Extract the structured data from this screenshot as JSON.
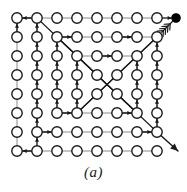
{
  "figure": {
    "caption": "(a)",
    "type": "node-link-grid-diagram"
  },
  "colors": {
    "background": "#ffffff",
    "node_stroke": "#1a1a1a",
    "node_fill": "#ffffff",
    "goal_fill": "#000000",
    "edge_plain": "#8a8a8a",
    "edge_directed": "#1a1a1a"
  },
  "grid": {
    "rows": 8,
    "cols": 8,
    "origin_x": 17,
    "origin_y": 18,
    "step_x": 20,
    "step_y": 19,
    "node_radius": 5.2,
    "node_stroke_width": 1.4
  },
  "goal_node": {
    "label": "goal",
    "row": 0,
    "col": 8,
    "x": 176,
    "y": 18,
    "radius": 4.2,
    "filled": true
  },
  "plain_edges": [
    {
      "r1": 0,
      "c1": 0,
      "r2": 0,
      "c2": 1
    },
    {
      "r1": 0,
      "c1": 1,
      "r2": 0,
      "c2": 2
    },
    {
      "r1": 0,
      "c1": 2,
      "r2": 0,
      "c2": 3
    },
    {
      "r1": 0,
      "c1": 3,
      "r2": 0,
      "c2": 4
    },
    {
      "r1": 0,
      "c1": 4,
      "r2": 0,
      "c2": 5
    },
    {
      "r1": 0,
      "c1": 5,
      "r2": 0,
      "c2": 6
    },
    {
      "r1": 0,
      "c1": 6,
      "r2": 0,
      "c2": 7
    },
    {
      "r1": 1,
      "c1": 2,
      "r2": 1,
      "c2": 3
    },
    {
      "r1": 1,
      "c1": 3,
      "r2": 1,
      "c2": 4
    },
    {
      "r1": 1,
      "c1": 4,
      "r2": 1,
      "c2": 5
    },
    {
      "r1": 1,
      "c1": 5,
      "r2": 1,
      "c2": 6
    },
    {
      "r1": 1,
      "c1": 6,
      "r2": 1,
      "c2": 7
    },
    {
      "r1": 2,
      "c1": 3,
      "r2": 2,
      "c2": 4
    },
    {
      "r1": 2,
      "c1": 4,
      "r2": 2,
      "c2": 5
    },
    {
      "r1": 2,
      "c1": 5,
      "r2": 2,
      "c2": 6
    },
    {
      "r1": 5,
      "c1": 2,
      "r2": 5,
      "c2": 3
    },
    {
      "r1": 5,
      "c1": 3,
      "r2": 5,
      "c2": 4
    },
    {
      "r1": 5,
      "c1": 4,
      "r2": 5,
      "c2": 5
    },
    {
      "r1": 5,
      "c1": 5,
      "r2": 5,
      "c2": 6
    },
    {
      "r1": 6,
      "c1": 1,
      "r2": 6,
      "c2": 2
    },
    {
      "r1": 6,
      "c1": 2,
      "r2": 6,
      "c2": 3
    },
    {
      "r1": 6,
      "c1": 3,
      "r2": 6,
      "c2": 4
    },
    {
      "r1": 6,
      "c1": 4,
      "r2": 6,
      "c2": 5
    },
    {
      "r1": 6,
      "c1": 5,
      "r2": 6,
      "c2": 6
    },
    {
      "r1": 6,
      "c1": 6,
      "r2": 6,
      "c2": 7
    },
    {
      "r1": 7,
      "c1": 0,
      "r2": 7,
      "c2": 1
    },
    {
      "r1": 7,
      "c1": 1,
      "r2": 7,
      "c2": 2
    },
    {
      "r1": 7,
      "c1": 2,
      "r2": 7,
      "c2": 3
    },
    {
      "r1": 7,
      "c1": 3,
      "r2": 7,
      "c2": 4
    },
    {
      "r1": 7,
      "c1": 4,
      "r2": 7,
      "c2": 5
    },
    {
      "r1": 7,
      "c1": 5,
      "r2": 7,
      "c2": 6
    },
    {
      "r1": 7,
      "c1": 6,
      "r2": 7,
      "c2": 7
    },
    {
      "r1": 0,
      "c1": 0,
      "r2": 1,
      "c2": 0
    },
    {
      "r1": 1,
      "c1": 0,
      "r2": 2,
      "c2": 0
    },
    {
      "r1": 2,
      "c1": 0,
      "r2": 3,
      "c2": 0
    },
    {
      "r1": 3,
      "c1": 0,
      "r2": 4,
      "c2": 0
    },
    {
      "r1": 4,
      "c1": 0,
      "r2": 5,
      "c2": 0
    },
    {
      "r1": 5,
      "c1": 0,
      "r2": 6,
      "c2": 0
    },
    {
      "r1": 6,
      "c1": 0,
      "r2": 7,
      "c2": 0
    },
    {
      "r1": 0,
      "c1": 1,
      "r2": 1,
      "c2": 1
    },
    {
      "r1": 1,
      "c1": 1,
      "r2": 2,
      "c2": 1
    },
    {
      "r1": 2,
      "c1": 1,
      "r2": 3,
      "c2": 1
    },
    {
      "r1": 3,
      "c1": 1,
      "r2": 4,
      "c2": 1
    },
    {
      "r1": 4,
      "c1": 1,
      "r2": 5,
      "c2": 1
    },
    {
      "r1": 5,
      "c1": 1,
      "r2": 6,
      "c2": 1
    },
    {
      "r1": 1,
      "c1": 2,
      "r2": 2,
      "c2": 2
    },
    {
      "r1": 2,
      "c1": 2,
      "r2": 3,
      "c2": 2
    },
    {
      "r1": 3,
      "c1": 2,
      "r2": 4,
      "c2": 2
    },
    {
      "r1": 4,
      "c1": 2,
      "r2": 5,
      "c2": 2
    },
    {
      "r1": 2,
      "c1": 3,
      "r2": 3,
      "c2": 3
    },
    {
      "r1": 3,
      "c1": 3,
      "r2": 4,
      "c2": 3
    },
    {
      "r1": 4,
      "c1": 3,
      "r2": 5,
      "c2": 3
    },
    {
      "r1": 1,
      "c1": 7,
      "r2": 2,
      "c2": 7
    },
    {
      "r1": 2,
      "c1": 7,
      "r2": 3,
      "c2": 7
    },
    {
      "r1": 3,
      "c1": 7,
      "r2": 4,
      "c2": 7
    },
    {
      "r1": 4,
      "c1": 7,
      "r2": 5,
      "c2": 7
    },
    {
      "r1": 5,
      "c1": 7,
      "r2": 6,
      "c2": 7
    },
    {
      "r1": 2,
      "c1": 6,
      "r2": 3,
      "c2": 6
    },
    {
      "r1": 3,
      "c1": 6,
      "r2": 4,
      "c2": 6
    },
    {
      "r1": 4,
      "c1": 6,
      "r2": 5,
      "c2": 6
    }
  ],
  "directed_edges": [
    {
      "from_r": 0,
      "from_c": 1,
      "to_r": 0,
      "to_c": 0,
      "note": "top row leftward"
    },
    {
      "from_r": 1,
      "from_c": 2,
      "to_r": 1,
      "to_c": 3,
      "note": "row2 rightward"
    },
    {
      "from_r": 1,
      "from_c": 5,
      "to_r": 1,
      "to_c": 6,
      "note": "row2 rightward"
    },
    {
      "from_r": 2,
      "from_c": 4,
      "to_r": 2,
      "to_c": 5,
      "note": "row3 rightward"
    },
    {
      "from_r": 5,
      "from_c": 2,
      "to_r": 5,
      "to_c": 3,
      "note": "row6 rightward"
    },
    {
      "from_r": 5,
      "from_c": 5,
      "to_r": 5,
      "to_c": 6,
      "note": "row6 rightward"
    },
    {
      "from_r": 6,
      "from_c": 1,
      "to_r": 6,
      "to_c": 2,
      "note": "row7 rightward"
    },
    {
      "from_r": 6,
      "from_c": 6,
      "to_r": 6,
      "to_c": 7,
      "note": "row7 rightward"
    },
    {
      "from_r": 7,
      "from_c": 1,
      "to_r": 7,
      "to_c": 0,
      "note": "bottom row leftward"
    },
    {
      "from_r": 1,
      "from_c": 0,
      "to_r": 0,
      "to_c": 0,
      "note": "col1 upward"
    },
    {
      "from_r": 1,
      "from_c": 1,
      "to_r": 0,
      "to_c": 1,
      "note": "col2 upward"
    },
    {
      "from_r": 2,
      "from_c": 1,
      "to_r": 1,
      "to_c": 1,
      "note": "col2 upward"
    },
    {
      "from_r": 3,
      "from_c": 1,
      "to_r": 2,
      "to_c": 1,
      "note": "col2 upward"
    },
    {
      "from_r": 4,
      "from_c": 1,
      "to_r": 3,
      "to_c": 1,
      "note": "col2 upward"
    },
    {
      "from_r": 5,
      "from_c": 1,
      "to_r": 4,
      "to_c": 1,
      "note": "col2 upward"
    },
    {
      "from_r": 6,
      "from_c": 1,
      "to_r": 5,
      "to_c": 1,
      "note": "col2 upward"
    },
    {
      "from_r": 2,
      "from_c": 2,
      "to_r": 1,
      "to_c": 2,
      "note": "col3 upward"
    },
    {
      "from_r": 3,
      "from_c": 2,
      "to_r": 2,
      "to_c": 2,
      "note": "col3 upward"
    },
    {
      "from_r": 4,
      "from_c": 2,
      "to_r": 3,
      "to_c": 2,
      "note": "col3 upward"
    },
    {
      "from_r": 5,
      "from_c": 2,
      "to_r": 4,
      "to_c": 2,
      "note": "col3 upward"
    },
    {
      "from_r": 3,
      "from_c": 3,
      "to_r": 2,
      "to_c": 3,
      "note": "col4 upward"
    },
    {
      "from_r": 4,
      "from_c": 3,
      "to_r": 3,
      "to_c": 3,
      "note": "col4 upward"
    },
    {
      "from_r": 5,
      "from_c": 3,
      "to_r": 4,
      "to_c": 3,
      "note": "col4 upward"
    },
    {
      "from_r": 3,
      "from_c": 6,
      "to_r": 2,
      "to_c": 6,
      "note": "col7 upward"
    },
    {
      "from_r": 4,
      "from_c": 6,
      "to_r": 3,
      "to_c": 6,
      "note": "col7 upward"
    },
    {
      "from_r": 5,
      "from_c": 6,
      "to_r": 4,
      "to_c": 6,
      "note": "col7 upward"
    },
    {
      "from_r": 2,
      "from_c": 7,
      "to_r": 1,
      "to_c": 7,
      "note": "col8 upward"
    },
    {
      "from_r": 3,
      "from_c": 7,
      "to_r": 2,
      "to_c": 7,
      "note": "col8 upward"
    },
    {
      "from_r": 4,
      "from_c": 7,
      "to_r": 3,
      "to_c": 7,
      "note": "col8 upward"
    },
    {
      "from_r": 5,
      "from_c": 7,
      "to_r": 4,
      "to_c": 7,
      "note": "col8 upward"
    },
    {
      "from_r": 6,
      "from_c": 7,
      "to_r": 5,
      "to_c": 7,
      "note": "col8 upward"
    },
    {
      "from_r": 7,
      "from_c": 1,
      "to_r": 6,
      "to_c": 1,
      "note": "col2 upward bottom"
    }
  ],
  "diagonal_edges": [
    {
      "from_r": 0,
      "from_c": 1,
      "to_r": 2,
      "to_c": 3,
      "note": "down-right diagonal from top"
    },
    {
      "from_r": 2,
      "from_c": 3,
      "to_r": 5,
      "to_c": 6,
      "note": "down-right diagonal continue"
    },
    {
      "from_r": 1,
      "from_c": 7,
      "to_r": 5,
      "to_c": 3,
      "note": "down-left long diagonal"
    },
    {
      "from_r": 5,
      "from_c": 3,
      "to_r": 1,
      "to_c": 7,
      "note": "up-right return"
    },
    {
      "from_r": 1,
      "from_c": 2,
      "to_r": 5,
      "to_c": 6,
      "note": "down-right inner diagonal"
    },
    {
      "from_r": 6,
      "from_c": 7,
      "to_r": 1,
      "to_c": 2,
      "note": "long up-left diagonal"
    }
  ],
  "goal_arrow": {
    "label": "converging-chevrons-to-goal",
    "chevron_count": 4,
    "direction": "up-right",
    "from_r": 1,
    "from_c": 7
  },
  "exit_arrow": {
    "label": "exit-arrow-bottom-right",
    "direction": "down-right",
    "from_r": 6,
    "from_c": 7,
    "tip_x": 178,
    "tip_y": 151
  }
}
